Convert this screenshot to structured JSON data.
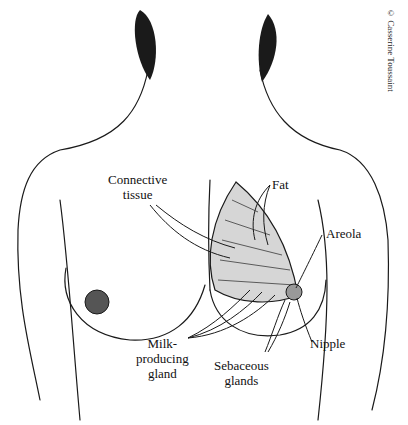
{
  "diagram": {
    "labels": {
      "connective_tissue": "Connective\ntissue",
      "fat": "Fat",
      "areola": "Areola",
      "milk_producing_gland": "Milk-\nproducing\ngland",
      "sebaceous_glands": "Sebaceous\nglands",
      "nipple": "Nipple"
    },
    "credit": "© Casserine Toussaint"
  }
}
